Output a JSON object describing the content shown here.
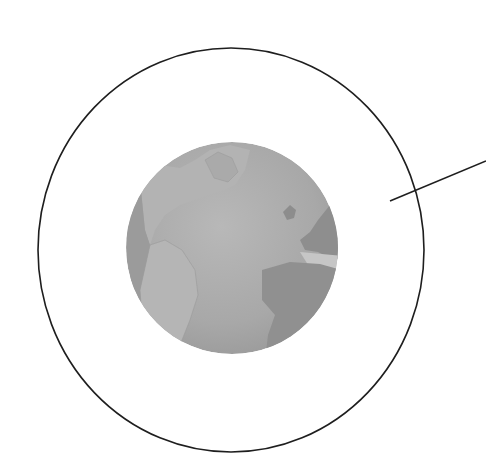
{
  "diagram": {
    "colors": {
      "background": "#ffffff",
      "outline": "#1e1e1e",
      "ocean": "#a9a9a9",
      "land": "#b6b6b6",
      "land_dark": "#8f8f8f",
      "highlight": "#c4c4c4"
    },
    "elements": [
      {
        "name": "outer-circle",
        "shape": "ellipse"
      },
      {
        "name": "globe",
        "shape": "circle"
      },
      {
        "name": "leader-line",
        "shape": "line"
      }
    ]
  }
}
